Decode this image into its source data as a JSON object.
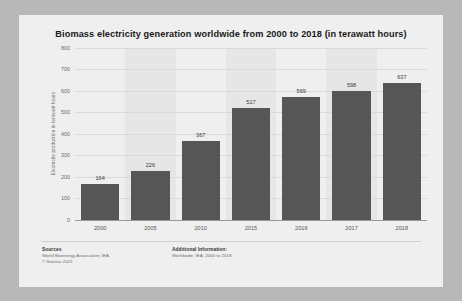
{
  "chart_data": {
    "type": "bar",
    "title": "Biomass electricity generation worldwide from 2000 to 2018 (in terawatt hours)",
    "categories": [
      "2000",
      "2005",
      "2010",
      "2015",
      "2016",
      "2017",
      "2018"
    ],
    "values": [
      164,
      226,
      367,
      517,
      569,
      598,
      637
    ],
    "xlabel": "",
    "ylabel": "Electricity production in terawatt hours",
    "ylim": [
      0,
      800
    ],
    "yticks": [
      "0",
      "100",
      "200",
      "300",
      "400",
      "500",
      "600",
      "700",
      "800"
    ],
    "ytick_values": [
      0,
      100,
      200,
      300,
      400,
      500,
      600,
      700,
      800
    ],
    "grid": true,
    "legend": "none",
    "bar_color": "#565656",
    "background_color": "#efefef"
  },
  "footer": {
    "sources_heading": "Sources",
    "sources_line1": "World Bioenergy Association; IEA",
    "sources_line2": "© Statista 2021",
    "additional_heading": "Additional Information:",
    "additional_line1": "Worldwide; IEA; 2000 to 2018"
  }
}
